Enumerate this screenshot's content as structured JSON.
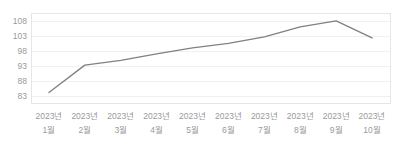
{
  "chart_data": {
    "type": "line",
    "title": "",
    "subtitle": "",
    "xlabel": "",
    "ylabel": "",
    "categories": [
      "2023년 1월",
      "2023년 2월",
      "2023년 3월",
      "2023년 4월",
      "2023년 5월",
      "2023년 6월",
      "2023년 7월",
      "2023년 8월",
      "2023년 9월",
      "2023년 10월"
    ],
    "category_lines": [
      [
        "2023년",
        "1월"
      ],
      [
        "2023년",
        "2월"
      ],
      [
        "2023년",
        "3월"
      ],
      [
        "2023년",
        "4월"
      ],
      [
        "2023년",
        "5월"
      ],
      [
        "2023년",
        "6월"
      ],
      [
        "2023년",
        "7월"
      ],
      [
        "2023년",
        "8월"
      ],
      [
        "2023년",
        "9월"
      ],
      [
        "2023년",
        "10월"
      ]
    ],
    "values": [
      84.0,
      93.2,
      94.8,
      97.0,
      99.0,
      100.5,
      102.7,
      106.0,
      108.0,
      102.3
    ],
    "series": [
      {
        "name": "series-1",
        "values": [
          84.0,
          93.2,
          94.8,
          97.0,
          99.0,
          100.5,
          102.7,
          106.0,
          108.0,
          102.3
        ],
        "color": "#808080"
      }
    ],
    "ylim": [
      80.5,
      110.5
    ],
    "yticks": [
      83,
      88,
      93,
      98,
      103,
      108
    ],
    "ytick_labels": [
      "83",
      "88",
      "93",
      "98",
      "103",
      "108"
    ],
    "grid": true,
    "grid_color": "#f0f0f0",
    "legend": false,
    "legend_position": "none",
    "line_color": "#808080",
    "axis_label_color": "#9a9a9a",
    "plot_border_color": "#e6e6e6",
    "background_color": "#ffffff",
    "markers": false,
    "annotations": []
  }
}
